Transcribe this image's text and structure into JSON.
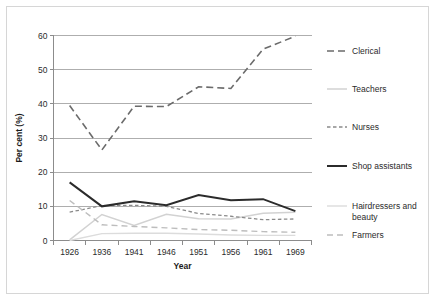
{
  "chart_data": {
    "type": "line",
    "title": "",
    "xlabel": "Year",
    "ylabel": "Per cent (%)",
    "categories": [
      "1926",
      "1936",
      "1941",
      "1946",
      "1951",
      "1956",
      "1961",
      "1969"
    ],
    "x_tick_labels": [
      "1926",
      "1936",
      "1941",
      "1946",
      "1951",
      "1956",
      "1961",
      "1969"
    ],
    "y_tick_labels": [
      "0",
      "10",
      "20",
      "30",
      "40",
      "50",
      "60"
    ],
    "y_ticks": [
      0,
      10,
      20,
      30,
      40,
      50,
      60
    ],
    "ylim": [
      0,
      60
    ],
    "grid": "horizontal",
    "legend_position": "right",
    "series": [
      {
        "name": "Clerical",
        "values": [
          39.5,
          26.5,
          39.3,
          39.2,
          45.0,
          44.5,
          56.0,
          59.8
        ],
        "color": "#6b6b6b",
        "dash": "7,4",
        "width": 1.6
      },
      {
        "name": "Teachers",
        "values": [
          0.2,
          7.6,
          4.4,
          7.7,
          6.4,
          6.3,
          8.0,
          8.3
        ],
        "color": "#d2d2d2",
        "dash": "none",
        "width": 1.5
      },
      {
        "name": "Nurses",
        "values": [
          8.3,
          10.2,
          10.3,
          10.0,
          7.9,
          7.1,
          6.1,
          6.3
        ],
        "color": "#8a8a8a",
        "dash": "3.5,2.5",
        "width": 1.3
      },
      {
        "name": "Shop assistants",
        "values": [
          17.0,
          10.0,
          11.5,
          10.3,
          13.3,
          11.8,
          12.1,
          8.6
        ],
        "color": "#2b2b2b",
        "dash": "none",
        "width": 2.0
      },
      {
        "name": "Hairdressers and beauty",
        "values": [
          0.0,
          2.0,
          2.1,
          2.1,
          1.9,
          1.6,
          1.5,
          1.5
        ],
        "color": "#dcdcdc",
        "dash": "none",
        "width": 1.4
      },
      {
        "name": "Farmers",
        "values": [
          11.7,
          4.6,
          4.1,
          3.7,
          3.2,
          3.0,
          2.6,
          2.4
        ],
        "color": "#bdbdbd",
        "dash": "6,4",
        "width": 1.4
      }
    ]
  },
  "legend": {
    "items": [
      {
        "label": "Clerical"
      },
      {
        "label": "Teachers"
      },
      {
        "label": "Nurses"
      },
      {
        "label": "Shop assistants"
      },
      {
        "label": "Hairdressers and",
        "label2": "beauty"
      },
      {
        "label": "Farmers"
      }
    ]
  }
}
